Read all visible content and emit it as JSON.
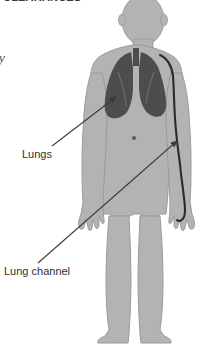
{
  "document": {
    "background_color": "#ffffff",
    "width": 216,
    "height": 346,
    "kind": "anatomical-diagram"
  },
  "header": {
    "clipped_title": "CLEARANCES",
    "side_fragment": "ry"
  },
  "labels": {
    "lungs": "Lungs",
    "lung_channel": "Lung channel"
  },
  "figure": {
    "alt": "Human body silhouette showing the lungs and the lung meridian channel running down the arm",
    "body_fill": "#b3b3b3",
    "body_stroke": "#8e8e8e",
    "organ_fill": "#4d4d4f",
    "channel_color": "#2b2b2d",
    "arrow_color": "#3a3a3c",
    "navel_color": "#5a5a5c"
  },
  "annotations": [
    {
      "name": "lungs",
      "label": "Lungs",
      "target": "left lung lower lobe",
      "arrow_from": [
        52,
        146
      ],
      "arrow_to": [
        118,
        96
      ]
    },
    {
      "name": "lung-channel",
      "label": "Lung channel",
      "target": "meridian line on inner forearm",
      "arrow_from": [
        38,
        263
      ],
      "arrow_to": [
        180,
        139
      ]
    }
  ]
}
